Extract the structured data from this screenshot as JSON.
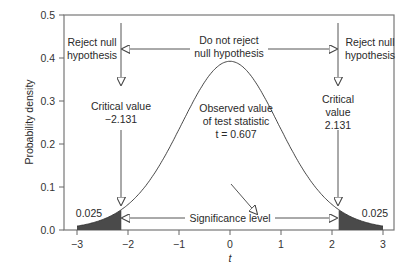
{
  "chart_data": {
    "type": "line",
    "title": "",
    "xlabel": "t",
    "ylabel": "Probability density",
    "xlim": [
      -3,
      3
    ],
    "ylim": [
      0,
      0.5
    ],
    "x_ticks": [
      "−3",
      "−2",
      "−1",
      "0",
      "1",
      "2",
      "3"
    ],
    "y_ticks": [
      "0.0",
      "0.1",
      "0.2",
      "0.3",
      "0.4",
      "0.5"
    ],
    "grid": false,
    "legend": null,
    "series": [
      {
        "name": "t distribution density",
        "x": [
          -3,
          -2.5,
          -2.131,
          -2,
          -1.5,
          -1,
          -0.5,
          0,
          0.5,
          1,
          1.5,
          2,
          2.131,
          2.5,
          3
        ],
        "values": [
          0.01,
          0.025,
          0.045,
          0.055,
          0.125,
          0.23,
          0.34,
          0.39,
          0.34,
          0.23,
          0.125,
          0.055,
          0.045,
          0.025,
          0.01
        ]
      }
    ],
    "shaded_regions": [
      {
        "from": -3,
        "to": -2.131,
        "label": "0.025"
      },
      {
        "from": 2.131,
        "to": 3,
        "label": "0.025"
      }
    ],
    "critical_values": [
      -2.131,
      2.131
    ],
    "observed_t": 0.607,
    "annotations": {
      "reject_left": [
        "Reject null",
        "hypothesis"
      ],
      "do_not_reject": [
        "Do not reject",
        "null hypothesis"
      ],
      "reject_right": [
        "Reject null",
        "hypothesis"
      ],
      "critical_left": [
        "Critical value",
        "−2.131"
      ],
      "critical_right": [
        "Critical",
        "value",
        "2.131"
      ],
      "observed": [
        "Observed value",
        "of test statistic",
        "t = 0.607"
      ],
      "significance": "Significance level",
      "tail_left": "0.025",
      "tail_right": "0.025"
    }
  },
  "colors": {
    "curve": "#333333",
    "shade": "#4a4a4a",
    "axis": "#555555"
  }
}
